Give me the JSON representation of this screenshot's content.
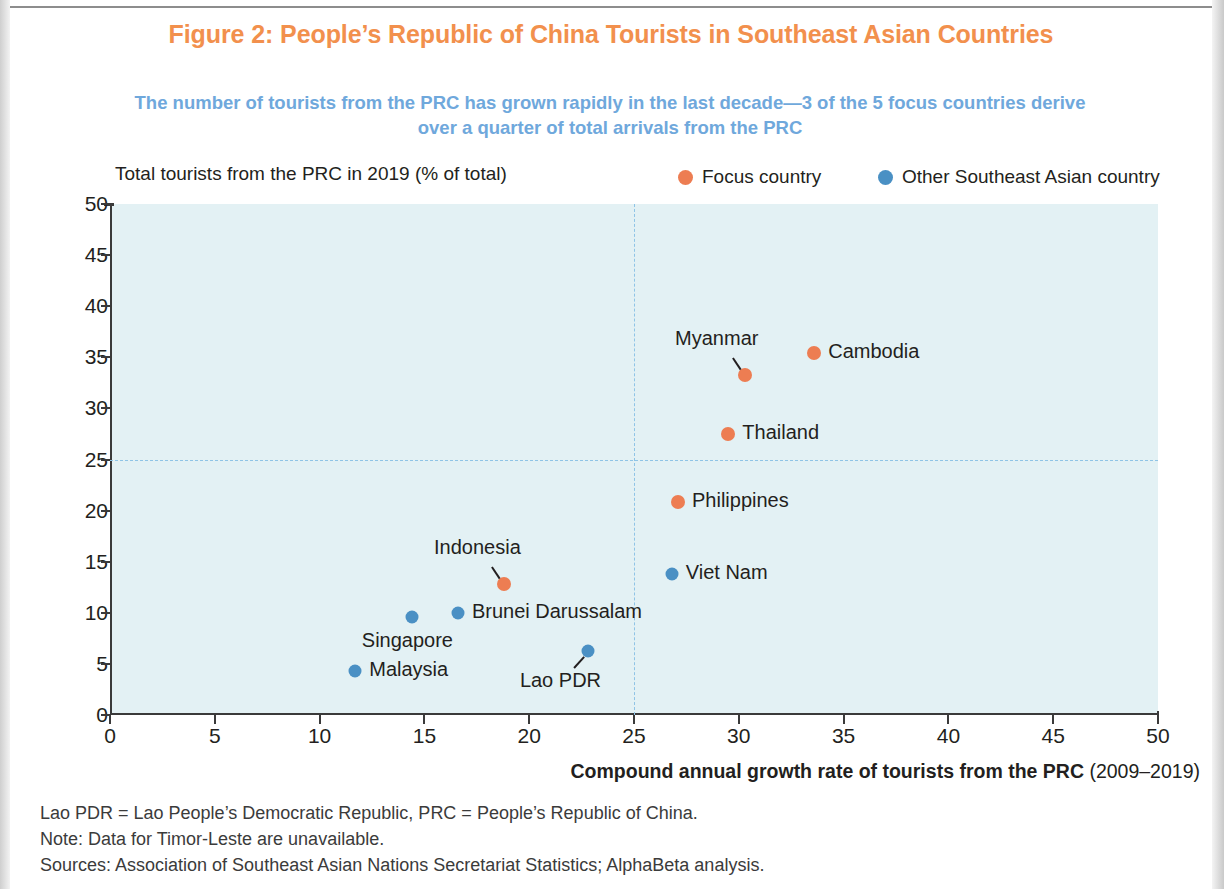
{
  "figure": {
    "title": "Figure 2: People’s Republic of China Tourists in Southeast Asian Countries",
    "subtitle": "The number of tourists from the PRC has grown rapidly in the last decade—3 of the 5 focus countries derive over a quarter of total arrivals from the PRC",
    "title_color": "#F2904D",
    "subtitle_color": "#6FA8DC"
  },
  "legend": {
    "position": "top-right",
    "items": [
      {
        "label": "Focus country",
        "color": "#ED7D52",
        "key": "focus"
      },
      {
        "label": "Other Southeast Asian country",
        "color": "#4A90C4",
        "key": "other"
      }
    ]
  },
  "notes": {
    "abbreviations": "Lao PDR = Lao People’s Democratic Republic, PRC = People’s Republic of China.",
    "note": "Note: Data for Timor-Leste are unavailable.",
    "sources": "Sources: Association of Southeast Asian Nations Secretariat Statistics; AlphaBeta analysis."
  },
  "chart_data": {
    "type": "scatter",
    "title": "Figure 2: People’s Republic of China Tourists in Southeast Asian Countries",
    "subtitle": "The number of tourists from the PRC has grown rapidly in the last decade—3 of the 5 focus countries derive over a quarter of total arrivals from the PRC",
    "xlabel": "Compound annual growth rate of tourists from the PRC (2009–2019)",
    "xlabel_bold_part": "Compound annual growth rate of tourists from the PRC",
    "xlabel_plain_part": "(2009–2019)",
    "ylabel": "Total tourists from the PRC in 2019 (% of total)",
    "xlim": [
      0,
      50
    ],
    "ylim": [
      0,
      50
    ],
    "xticks": [
      0,
      5,
      10,
      15,
      20,
      25,
      30,
      35,
      40,
      45,
      50
    ],
    "yticks": [
      0,
      5,
      10,
      15,
      20,
      25,
      30,
      35,
      40,
      45,
      50
    ],
    "grid": false,
    "plot_background": "#E3F1F4",
    "reference_lines": [
      {
        "axis": "y",
        "value": 25,
        "style": "dashed",
        "color": "#8FC4E6"
      },
      {
        "axis": "x",
        "value": 25,
        "style": "dashed",
        "color": "#8FC4E6"
      }
    ],
    "series": [
      {
        "name": "Focus country",
        "color": "#ED7D52",
        "points": [
          {
            "label": "Cambodia",
            "x": 33.6,
            "y": 35.4,
            "label_pos": "right"
          },
          {
            "label": "Myanmar",
            "x": 30.3,
            "y": 33.3,
            "label_pos": "leader-upleft"
          },
          {
            "label": "Thailand",
            "x": 29.5,
            "y": 27.5,
            "label_pos": "right"
          },
          {
            "label": "Philippines",
            "x": 27.1,
            "y": 20.8,
            "label_pos": "right"
          },
          {
            "label": "Indonesia",
            "x": 18.8,
            "y": 12.8,
            "label_pos": "leader-upleft"
          }
        ]
      },
      {
        "name": "Other Southeast Asian country",
        "color": "#4A90C4",
        "points": [
          {
            "label": "Viet Nam",
            "x": 26.8,
            "y": 13.8,
            "label_pos": "right"
          },
          {
            "label": "Lao PDR",
            "x": 22.8,
            "y": 6.3,
            "label_pos": "leader-downleft"
          },
          {
            "label": "Brunei Darussalam",
            "x": 16.6,
            "y": 10.0,
            "label_pos": "right"
          },
          {
            "label": "Singapore",
            "x": 14.4,
            "y": 9.6,
            "label_pos": "below-left"
          },
          {
            "label": "Malaysia",
            "x": 11.7,
            "y": 4.3,
            "label_pos": "right"
          }
        ]
      }
    ]
  }
}
